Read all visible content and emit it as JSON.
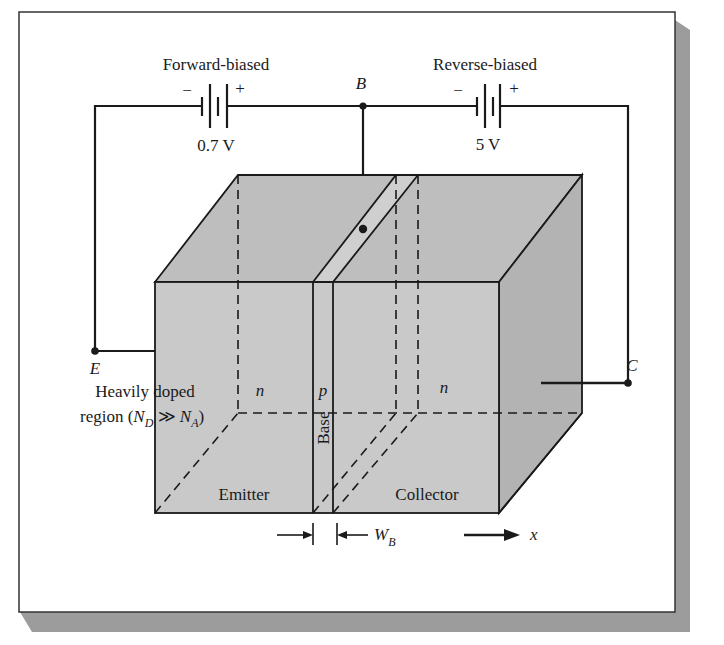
{
  "figure": {
    "colors": {
      "frame_border": "#2a2a2a",
      "shadow": "#9a9a9a",
      "block_front": "#c8c8c8",
      "block_top": "#bdbdbd",
      "block_side": "#b4b4b4",
      "line": "#1a1a1a",
      "background": "#ffffff"
    }
  },
  "circuit": {
    "forward_battery": {
      "label": "Forward-biased",
      "voltage": "0.7 V",
      "minus": "−",
      "plus": "+"
    },
    "reverse_battery": {
      "label": "Reverse-biased",
      "voltage": "5 V",
      "minus": "−",
      "plus": "+"
    },
    "terminals": {
      "base": "B",
      "emitter": "E",
      "collector": "C"
    }
  },
  "device": {
    "emitter_type": "n",
    "base_type": "p",
    "collector_type": "n",
    "emitter_label": "Emitter",
    "base_label": "Base",
    "collector_label": "Collector",
    "heavy_doping_line1": "Heavily doped",
    "heavy_doping_line2_prefix": "region (",
    "heavy_doping_ND": "N",
    "heavy_doping_ND_sub": "D",
    "heavy_doping_rel": " ≫ ",
    "heavy_doping_NA": "N",
    "heavy_doping_NA_sub": "A",
    "heavy_doping_suffix": ")"
  },
  "dimensions": {
    "base_width_symbol": "W",
    "base_width_sub": "B",
    "axis_label": "x"
  }
}
